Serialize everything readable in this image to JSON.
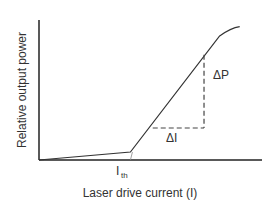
{
  "chart_data": {
    "type": "line",
    "title": "",
    "xlabel": "Laser drive current (I)",
    "ylabel": "Relative output power",
    "annotations": {
      "threshold_label": "I",
      "threshold_sub": "th",
      "delta_p": "ΔP",
      "delta_i": "ΔI"
    },
    "series": [
      {
        "name": "output power",
        "points": [
          [
            0,
            0
          ],
          [
            0.41,
            0.06
          ],
          [
            0.81,
            0.93
          ],
          [
            0.86,
            0.99
          ],
          [
            0.9,
            1.0
          ]
        ]
      }
    ],
    "threshold_x": 0.41,
    "dashed_triangle": {
      "x0": 0.51,
      "x1": 0.74,
      "y_low": 0.24,
      "y_high": 0.79
    },
    "xlim": [
      0,
      1
    ],
    "ylim": [
      0,
      1.05
    ],
    "grid": false
  }
}
